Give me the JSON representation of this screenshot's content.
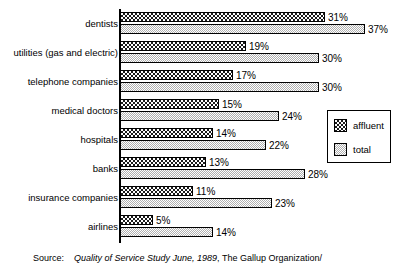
{
  "chart_data": {
    "type": "bar",
    "orientation": "horizontal",
    "title": "",
    "xlabel": "",
    "ylabel": "",
    "xlim": [
      0,
      40
    ],
    "grid": false,
    "legend_position": "right",
    "categories": [
      "dentists",
      "utilities (gas and electric)",
      "telephone companies",
      "medical doctors",
      "hospitals",
      "banks",
      "insurance companies",
      "airlines"
    ],
    "series": [
      {
        "name": "affluent",
        "values": [
          31,
          19,
          17,
          15,
          14,
          13,
          11,
          5
        ],
        "labels": [
          "31%",
          "19%",
          "17%",
          "15%",
          "14%",
          "13%",
          "11%",
          "5%"
        ],
        "fill": "checkerboard-dark",
        "color": "#1a1a1a"
      },
      {
        "name": "total",
        "values": [
          37,
          30,
          30,
          24,
          22,
          28,
          23,
          14
        ],
        "labels": [
          "37%",
          "30%",
          "30%",
          "24%",
          "22%",
          "28%",
          "23%",
          "14%"
        ],
        "fill": "dotted-light-gray",
        "color": "#c9c9c9"
      }
    ]
  },
  "legend": {
    "items": [
      {
        "label": "affluent"
      },
      {
        "label": "total"
      }
    ]
  },
  "source": {
    "label": "Source:",
    "title": "Quality of Service Study June, 1989",
    "publisher": ", The Gallup Organization/"
  }
}
